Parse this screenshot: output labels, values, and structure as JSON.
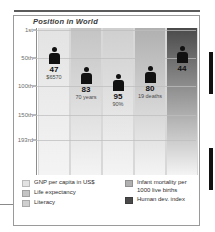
{
  "header": {
    "ghost_text": "",
    "rule_color": "#5b5b5b"
  },
  "chart_data": {
    "type": "bar",
    "title": "Position in World",
    "xlabel": "",
    "ylabel": "Position in World",
    "ylim": [
      1,
      193
    ],
    "y_inverted": true,
    "grid": true,
    "legend_position": "bottom",
    "axis_ticks": [
      {
        "label": "1st",
        "value": 1
      },
      {
        "label": "50th",
        "value": 50
      },
      {
        "label": "100th",
        "value": 100
      },
      {
        "label": "150th",
        "value": 150
      },
      {
        "label": "193rd",
        "value": 193
      }
    ],
    "categories": [
      "GNP per capita in US$",
      "Life expectancy",
      "Literacy",
      "Infant mortality per 1000 live births",
      "Human dev. index"
    ],
    "values": [
      47,
      83,
      95,
      80,
      44
    ],
    "value_labels": [
      "47",
      "83",
      "95",
      "80",
      "44"
    ],
    "sub_labels": [
      "$6570",
      "70 years",
      "90%",
      "19 deaths",
      ""
    ],
    "bar_colors": [
      "#e3e3e3",
      "#c4c4c4",
      "#cfcfcf",
      "#b0b0b0",
      "#4a4a4a"
    ],
    "series": [
      {
        "name": "Position in World",
        "values": [
          47,
          83,
          95,
          80,
          44
        ]
      }
    ]
  },
  "legend": {
    "left": [
      {
        "label": "GNP per capita in US$",
        "color": "#e3e3e3"
      },
      {
        "label": "Life expectancy",
        "color": "#c4c4c4"
      },
      {
        "label": "Literacy",
        "color": "#cfcfcf"
      }
    ],
    "right": [
      {
        "label": "Infant mortality per\n1000 live births",
        "color": "#b0b0b0"
      },
      {
        "label": "Human dev. index",
        "color": "#4a4a4a"
      }
    ]
  }
}
